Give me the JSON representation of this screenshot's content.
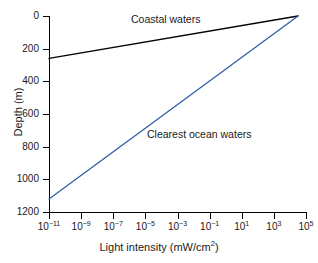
{
  "chart_data": {
    "type": "line",
    "title": "",
    "xlabel": "Light intensity (mW/cm²)",
    "xlabel_base": "Light intensity (mW/cm",
    "xlabel_sup": "2",
    "xlabel_tail": ")",
    "ylabel": "Depth (m)",
    "xscale": "log",
    "xlim": [
      1e-11,
      100000.0
    ],
    "ylim": [
      1200,
      0
    ],
    "y_inverted": true,
    "grid": false,
    "legend": "inline-annotations",
    "xticks": [
      {
        "value": 1e-11,
        "mantissa": "10",
        "exponent": "-11"
      },
      {
        "value": 1e-09,
        "mantissa": "10",
        "exponent": "-9"
      },
      {
        "value": 1e-07,
        "mantissa": "10",
        "exponent": "-7"
      },
      {
        "value": 1e-05,
        "mantissa": "10",
        "exponent": "-5"
      },
      {
        "value": 0.001,
        "mantissa": "10",
        "exponent": "-3"
      },
      {
        "value": 0.1,
        "mantissa": "10",
        "exponent": "-1"
      },
      {
        "value": 10.0,
        "mantissa": "10",
        "exponent": "1"
      },
      {
        "value": 1000.0,
        "mantissa": "10",
        "exponent": "3"
      },
      {
        "value": 100000.0,
        "mantissa": "10",
        "exponent": "5"
      }
    ],
    "yticks": [
      0,
      200,
      400,
      600,
      800,
      1000,
      1200
    ],
    "series": [
      {
        "name": "Coastal waters",
        "color": "#000000",
        "label_position": "above-line",
        "points": [
          {
            "x": 1e-11,
            "depth": 260
          },
          {
            "x": 32000.0,
            "depth": 0
          }
        ]
      },
      {
        "name": "Clearest ocean waters",
        "color": "#2E5FA3",
        "label_position": "right-of-line",
        "points": [
          {
            "x": 1e-11,
            "depth": 1120
          },
          {
            "x": 32000.0,
            "depth": 0
          }
        ]
      }
    ]
  }
}
